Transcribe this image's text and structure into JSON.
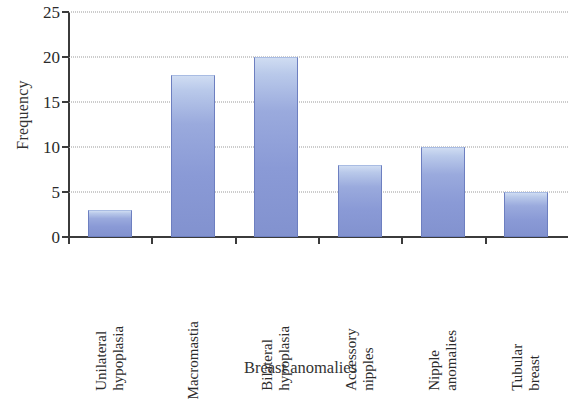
{
  "chart_data": {
    "type": "bar",
    "title": "",
    "xlabel": "Breast anomalies",
    "ylabel": "Frequency",
    "categories": [
      "Unilateral hypoplasia",
      "Macromastia",
      "Bilateral hypoplasia",
      "Accessory nipples",
      "Nipple anomalies",
      "Tubular breast"
    ],
    "category_lines": [
      [
        "Unilateral",
        "hypoplasia"
      ],
      [
        "Macromastia",
        ""
      ],
      [
        "Bilateral",
        "hypoplasia"
      ],
      [
        "Accessory",
        "nipples"
      ],
      [
        "Nipple",
        "anomalies"
      ],
      [
        "Tubular",
        "breast"
      ]
    ],
    "values": [
      3,
      18,
      20,
      8,
      10,
      5
    ],
    "ylim": [
      0,
      25
    ],
    "ytick_labels": [
      "0",
      "5",
      "10",
      "15",
      "20",
      "25"
    ],
    "ytick_values": [
      0,
      5,
      10,
      15,
      20,
      25
    ],
    "grid": "horizontal-dotted",
    "legend": "none",
    "bar_color": "#8a9ad6",
    "bar_highlight_color": "#cfdcf2",
    "bar_edge_color": "#6d7fc0",
    "axis_color": "#3b3b3b",
    "gridline_color": "#9a9a9a",
    "background_color": "#ffffff"
  }
}
